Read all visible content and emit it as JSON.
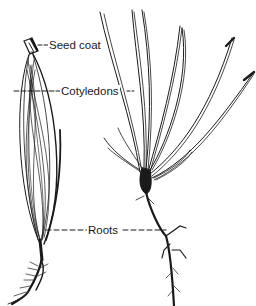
{
  "diagram": {
    "labels": {
      "seed_coat": "Seed coat",
      "cotyledons": "Cotyledons",
      "roots": "Roots"
    },
    "figures": [
      {
        "name": "germinating-seed",
        "description": "Seed with emerging cotyledons enclosed, capped by seed coat, roots below"
      },
      {
        "name": "seedling",
        "description": "Young seedling with spreading needle-like cotyledons and taproot"
      }
    ],
    "colors": {
      "ink": "#1a1a1a",
      "background": "#ffffff"
    }
  }
}
